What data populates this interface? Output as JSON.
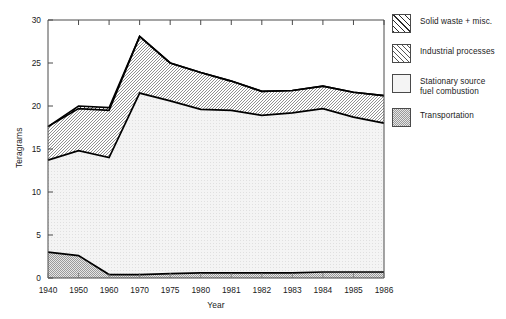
{
  "chart_data": {
    "type": "area",
    "stacked": true,
    "title": "",
    "xlabel": "Year",
    "ylabel": "Teragrams",
    "categories": [
      "1940",
      "1950",
      "1960",
      "1970",
      "1975",
      "1980",
      "1981",
      "1982",
      "1983",
      "1984",
      "1985",
      "1986"
    ],
    "ylim": [
      0,
      30
    ],
    "yticks": [
      0,
      5,
      10,
      15,
      20,
      25,
      30
    ],
    "grid": false,
    "legend_position": "right",
    "series": [
      {
        "name": "Transportation",
        "swatch": "fine-dotted",
        "values": [
          3.0,
          2.6,
          0.4,
          0.4,
          0.5,
          0.6,
          0.6,
          0.6,
          0.6,
          0.7,
          0.7,
          0.7
        ]
      },
      {
        "name": "Stationary source fuel combustion",
        "swatch": "plain-light",
        "values": [
          10.7,
          12.2,
          13.6,
          21.1,
          20.1,
          19.0,
          18.9,
          18.3,
          18.6,
          19.0,
          18.0,
          17.3
        ]
      },
      {
        "name": "Industrial processes",
        "swatch": "sparse-hatch",
        "values": [
          3.9,
          4.9,
          5.5,
          6.6,
          4.4,
          4.3,
          3.4,
          2.8,
          2.6,
          2.6,
          2.9,
          3.2
        ]
      },
      {
        "name": "Solid waste + misc.",
        "swatch": "dense-hatch",
        "values": [
          0.0,
          0.3,
          0.3,
          0.0,
          0.0,
          0.0,
          0.0,
          0.0,
          0.0,
          0.0,
          0.0,
          0.0
        ]
      }
    ],
    "cumulative_tops": {
      "transportation": [
        3.0,
        2.6,
        0.4,
        0.4,
        0.5,
        0.6,
        0.6,
        0.6,
        0.6,
        0.7,
        0.7,
        0.7
      ],
      "stationary": [
        13.7,
        14.8,
        14.0,
        21.5,
        20.6,
        19.6,
        19.5,
        18.9,
        19.2,
        19.7,
        18.7,
        18.0
      ],
      "industrial": [
        17.6,
        19.7,
        19.5,
        28.1,
        25.0,
        23.9,
        22.9,
        21.7,
        21.8,
        22.3,
        21.6,
        21.2
      ],
      "solid_waste": [
        17.6,
        20.0,
        19.8,
        28.1,
        25.0,
        23.9,
        22.9,
        21.7,
        21.8,
        22.3,
        21.6,
        21.2
      ]
    }
  },
  "legend": {
    "items": [
      {
        "label": "Solid waste + misc."
      },
      {
        "label": "Industrial processes"
      },
      {
        "label": "Stationary source\nfuel combustion"
      },
      {
        "label": "Transportation"
      }
    ]
  },
  "axes": {
    "ylabel": "Teragrams",
    "xlabel": "Year",
    "ytick_labels": [
      "0",
      "5",
      "10",
      "15",
      "20",
      "25",
      "30"
    ],
    "xtick_labels": [
      "1940",
      "1950",
      "1960",
      "1970",
      "1975",
      "1980",
      "1981",
      "1982",
      "1983",
      "1984",
      "1985",
      "1986"
    ]
  },
  "colors": {
    "line": "#000000",
    "axis": "#4a4a4a",
    "text": "#1a1a1a",
    "background": "#ffffff",
    "band_stationary": "#f2f2f2",
    "band_transportation": "#c9c9c9"
  }
}
